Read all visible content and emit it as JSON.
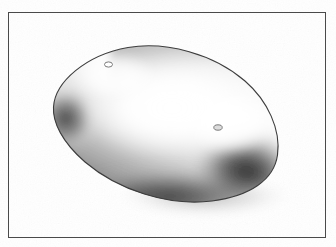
{
  "figure": {
    "title": "Perspective drawing of an elongated ovoid body",
    "medium": "scanned line drawing with airbrush tonal shading",
    "canvas": {
      "width": 336,
      "height": 247,
      "background_color": "#ffffff"
    },
    "frame": {
      "name": "border-frame",
      "stroke_color": "#4a4a4a",
      "stroke_width": 1,
      "x": 8,
      "y": 12,
      "width": 318,
      "height": 226
    },
    "object": {
      "name": "ovoid-body",
      "shape": "elongated ovoid / capsule",
      "outline_color": "#3d3d3d",
      "outline_width": 1.1,
      "fill_highlight_color": "#ffffff",
      "fill_shadow_color": "#2a2a2a",
      "fill_midtone_color": "#9a9a9a",
      "bounds": {
        "left": 52,
        "top": 46,
        "right": 279,
        "bottom": 202
      },
      "extremes": {
        "left_tip": [
          53,
          106
        ],
        "top_apex": [
          136,
          47
        ],
        "right_tip": [
          278,
          160
        ],
        "bottom_apex": [
          200,
          201
        ]
      },
      "highlight_center": [
        168,
        112
      ],
      "shadow_regions": [
        "lower-left rim",
        "lower-right tip",
        "bottom edge"
      ],
      "drop_shadow_color": "#bdbdbd"
    },
    "markers": [
      {
        "name": "aperture-upper-left",
        "label": "hole",
        "cx": 108.5,
        "cy": 64.5,
        "rx": 4.0,
        "ry": 2.6,
        "stroke_color": "#6b6b6b",
        "fill_color": "#ffffff"
      },
      {
        "name": "aperture-lower-right",
        "label": "hole",
        "cx": 218.0,
        "cy": 127.5,
        "rx": 4.2,
        "ry": 2.7,
        "stroke_color": "#6b6b6b",
        "fill_color": "#dcdcdc"
      }
    ],
    "paper": {
      "noise_color": "#f2f1ef",
      "margin_color": "#fefefe"
    }
  }
}
